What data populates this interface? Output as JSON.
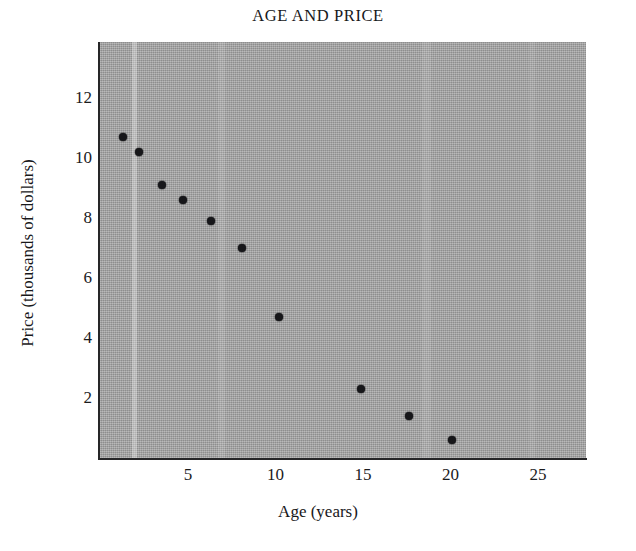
{
  "chart_data": {
    "type": "scatter",
    "title": "AGE AND PRICE",
    "xlabel": "Age (years)",
    "ylabel": "Price (thousands of dollars)",
    "xlim": [
      0,
      27.8
    ],
    "ylim": [
      0,
      12.9
    ],
    "grid": false,
    "legend": null,
    "xticks": [
      5,
      10,
      15,
      20,
      25
    ],
    "yticks": [
      2,
      4,
      6,
      8,
      10,
      12
    ],
    "xtick_labels": [
      "5",
      "10",
      "15",
      "20",
      "25"
    ],
    "ytick_labels": [
      "2",
      "4",
      "6",
      "8",
      "10",
      "12"
    ],
    "marker": "filled-circle",
    "marker_color": "#17171a",
    "plot_background_color": "#9e9e9e",
    "figure_background_color": "#ffffff",
    "x": [
      1.3,
      2.2,
      3.5,
      4.7,
      6.3,
      8.1,
      10.2,
      14.9,
      17.6,
      20.1
    ],
    "y": [
      10.7,
      10.2,
      9.1,
      8.6,
      7.9,
      7.0,
      4.7,
      2.3,
      1.4,
      0.6
    ],
    "points": [
      {
        "age": 1.3,
        "price": 10.7
      },
      {
        "age": 2.2,
        "price": 10.2
      },
      {
        "age": 3.5,
        "price": 9.1
      },
      {
        "age": 4.7,
        "price": 8.6
      },
      {
        "age": 6.3,
        "price": 7.9
      },
      {
        "age": 8.1,
        "price": 7.0
      },
      {
        "age": 10.2,
        "price": 4.7
      },
      {
        "age": 14.9,
        "price": 2.3
      },
      {
        "age": 17.6,
        "price": 1.4
      },
      {
        "age": 20.1,
        "price": 0.6
      }
    ]
  }
}
